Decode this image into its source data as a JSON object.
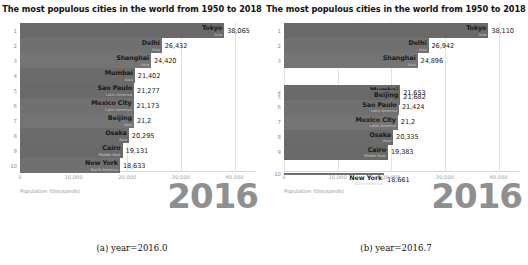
{
  "figure": {
    "panels": [
      {
        "id": "panel-a",
        "title": "The most populous cities in the world from 1950 to 2018",
        "caption": "(a) year=2016.0",
        "year_overlay": "2016",
        "axis_label": "Population (thousands)",
        "xticks": [
          "0",
          "10,000",
          "20,000",
          "30,000",
          "40,000"
        ]
      },
      {
        "id": "panel-b",
        "title": "The most populous cities in the world from 1950 to 2018",
        "caption": "(b) year=2016.7",
        "year_overlay": "2016",
        "axis_label": "Population (thousands)",
        "xticks": [
          "0",
          "10,000",
          "20,000",
          "30,000",
          "40,000"
        ]
      }
    ]
  },
  "chart_data": [
    {
      "type": "bar",
      "orientation": "horizontal",
      "title": "The most populous cities in the world from 1950 to 2018",
      "subtitle": "(a) year=2016.0",
      "xlabel": "Population (thousands)",
      "ylabel": "",
      "xlim": [
        0,
        44000
      ],
      "xticks": [
        0,
        10000,
        20000,
        30000,
        40000
      ],
      "xticklabels": [
        "0",
        "10,000",
        "20,000",
        "30,000",
        "40,000"
      ],
      "grid": true,
      "legend": "none",
      "annotation": "2016",
      "categories": [
        "Tokyo",
        "Delhi",
        "Shanghai",
        "Mumbai",
        "Sao Paulo",
        "Mexico City",
        "Beijing",
        "Osaka",
        "Cairo",
        "New York"
      ],
      "values": [
        38065,
        26432,
        24420,
        21402,
        21277,
        21173,
        21240,
        20295,
        19131,
        18633
      ],
      "value_labels": [
        "38,065",
        "26,432",
        "24,420",
        "21,402",
        "21,277",
        "21,173",
        "21,2",
        "20,295",
        "19,131",
        "18,633"
      ],
      "ranks": [
        "1",
        "2",
        "3",
        "4",
        "5",
        "6",
        "7",
        "8",
        "9",
        "10"
      ],
      "regions": [
        "Asia",
        "Asia",
        "Asia",
        "Asia",
        "Latin America",
        "Latin America",
        "Asia",
        "Asia",
        "Middle East",
        "North America"
      ],
      "bars": [
        {
          "rank": "1",
          "name": "Tokyo",
          "region": "Asia",
          "value": 38065,
          "label": "38,065",
          "y_slot": 0,
          "height": 1.0
        },
        {
          "rank": "2",
          "name": "Delhi",
          "region": "Asia",
          "value": 26432,
          "label": "26,432",
          "y_slot": 1,
          "height": 1.0
        },
        {
          "rank": "3",
          "name": "Shanghai",
          "region": "Asia",
          "value": 24420,
          "label": "24,420",
          "y_slot": 2,
          "height": 1.0
        },
        {
          "rank": "4",
          "name": "Mumbai",
          "region": "Asia",
          "value": 21402,
          "label": "21,402",
          "y_slot": 3,
          "height": 1.0
        },
        {
          "rank": "5",
          "name": "Sao Paulo",
          "region": "Latin America",
          "value": 21277,
          "label": "21,277",
          "y_slot": 4,
          "height": 1.0
        },
        {
          "rank": "6",
          "name": "Mexico City",
          "region": "Latin America",
          "value": 21173,
          "label": "21,173",
          "y_slot": 5,
          "height": 1.0
        },
        {
          "rank": "7",
          "name": "Beijing",
          "region": "Asia",
          "value": 21240,
          "label": "21,2",
          "y_slot": 6,
          "height": 1.0
        },
        {
          "rank": "8",
          "name": "Osaka",
          "region": "Asia",
          "value": 20295,
          "label": "20,295",
          "y_slot": 7,
          "height": 1.0
        },
        {
          "rank": "9",
          "name": "Cairo",
          "region": "Middle East",
          "value": 19131,
          "label": "19,131",
          "y_slot": 8,
          "height": 1.0
        },
        {
          "rank": "10",
          "name": "New York",
          "region": "North America",
          "value": 18633,
          "label": "18,633",
          "y_slot": 9,
          "height": 1.0
        }
      ]
    },
    {
      "type": "bar",
      "orientation": "horizontal",
      "title": "The most populous cities in the world from 1950 to 2018",
      "subtitle": "(b) year=2016.7",
      "xlabel": "Population (thousands)",
      "ylabel": "",
      "xlim": [
        0,
        44000
      ],
      "xticks": [
        0,
        10000,
        20000,
        30000,
        40000
      ],
      "xticklabels": [
        "0",
        "10,000",
        "20,000",
        "30,000",
        "40,000"
      ],
      "grid": true,
      "legend": "none",
      "annotation": "2016",
      "categories": [
        "Tokyo",
        "Delhi",
        "Shanghai",
        "Mumbai",
        "Beijing",
        "Sao Paulo",
        "Mexico City",
        "Osaka",
        "Cairo",
        "New York"
      ],
      "values": [
        38110,
        26942,
        24896,
        21653,
        21682,
        21424,
        21230,
        20335,
        19383,
        18661
      ],
      "value_labels": [
        "38,110",
        "26,942",
        "24,896",
        "21,653",
        "21,682",
        "21,424",
        "21,2",
        "20,335",
        "19,383",
        "18,661"
      ],
      "ranks": [
        "1",
        "2",
        "3",
        "4",
        "5",
        "6",
        "7",
        "8",
        "9",
        "10"
      ],
      "regions": [
        "Asia",
        "Asia",
        "Asia",
        "Asia",
        "Asia",
        "Latin America",
        "Latin America",
        "Asia",
        "Middle East",
        "North America"
      ],
      "bars": [
        {
          "rank": "1",
          "name": "Tokyo",
          "region": "Asia",
          "value": 38110,
          "label": "38,110",
          "y_slot": 0,
          "height": 1.0
        },
        {
          "rank": "2",
          "name": "Delhi",
          "region": "Asia",
          "value": 26942,
          "label": "26,942",
          "y_slot": 1,
          "height": 1.0
        },
        {
          "rank": "3",
          "name": "Shanghai",
          "region": "Asia",
          "value": 24896,
          "label": "24,896",
          "y_slot": 2,
          "height": 1.0
        },
        {
          "rank": "4",
          "name": "Mumbai",
          "region": "Asia",
          "value": 21653,
          "label": "21,653",
          "y_slot": 4.15,
          "height": 1.0
        },
        {
          "rank": "5",
          "name": "Beijing",
          "region": "Asia",
          "value": 21682,
          "label": "21,682",
          "y_slot": 4.45,
          "height": 1.0
        },
        {
          "rank": "6",
          "name": "Sao Paulo",
          "region": "Latin America",
          "value": 21424,
          "label": "21,424",
          "y_slot": 5.1,
          "height": 1.0
        },
        {
          "rank": "7",
          "name": "Mexico City",
          "region": "Latin America",
          "value": 21230,
          "label": "21,2",
          "y_slot": 6.1,
          "height": 1.0
        },
        {
          "rank": "8",
          "name": "Osaka",
          "region": "Asia",
          "value": 20335,
          "label": "20,335",
          "y_slot": 7.1,
          "height": 1.0
        },
        {
          "rank": "9",
          "name": "Cairo",
          "region": "Middle East",
          "value": 19383,
          "label": "19,383",
          "y_slot": 8.1,
          "height": 1.0
        },
        {
          "rank": "10",
          "name": "New York",
          "region": "North America",
          "value": 18661,
          "label": "18,661",
          "y_slot": 9.55,
          "height": 0.16
        }
      ]
    }
  ]
}
